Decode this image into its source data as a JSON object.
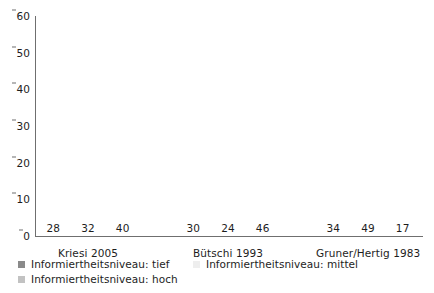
{
  "chart_data": {
    "type": "bar",
    "title": "",
    "subtitle": "",
    "xlabel": "",
    "ylabel": "",
    "ylim": [
      0,
      60
    ],
    "yticks": [
      0,
      10,
      20,
      30,
      40,
      50,
      60
    ],
    "grid": false,
    "legend_position": "bottom-left",
    "categories": [
      "Kriesi 2005",
      "Bütschi 1993",
      "Gruner/Hertig 1983"
    ],
    "series": [
      {
        "name": "Informiertheitsniveau: tief",
        "color": "#8a8a8a",
        "values": [
          28,
          30,
          34
        ]
      },
      {
        "name": "Informiertheitsniveau: mittel",
        "color": "#eeeeee",
        "values": [
          32,
          24,
          49
        ]
      },
      {
        "name": "Informiertheitsniveau: hoch",
        "color": "#c2c2c2",
        "values": [
          40,
          46,
          17
        ]
      }
    ],
    "data_labels": [
      [
        "28",
        "32",
        "40"
      ],
      [
        "30",
        "24",
        "46"
      ],
      [
        "34",
        "49",
        "17"
      ]
    ]
  },
  "axis": {
    "y_tick_labels": [
      "60",
      "50",
      "40",
      "30",
      "20",
      "10",
      "0"
    ]
  },
  "legend": {
    "row1": [
      {
        "label": "Informiertheitsniveau: tief",
        "color": "#8a8a8a"
      },
      {
        "label": "Informiertheitsniveau: mittel",
        "color": "#eeeeee"
      }
    ],
    "row2": [
      {
        "label": "Informiertheitsniveau: hoch",
        "color": "#c2c2c2"
      }
    ]
  }
}
